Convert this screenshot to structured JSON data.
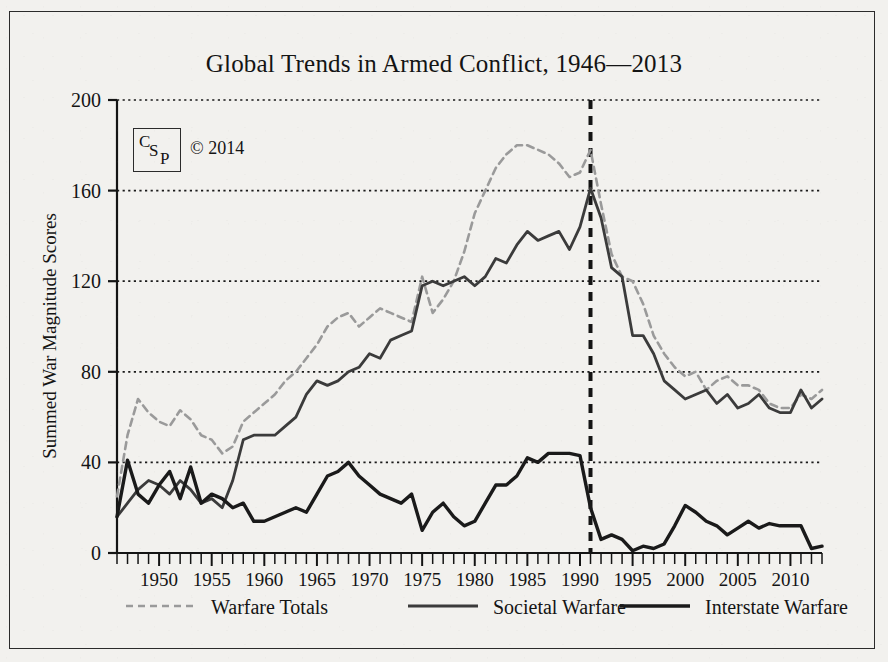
{
  "figure": {
    "background_color": "#f2f1ee",
    "frame_color": "#2b2b2b",
    "ink_color": "#141414"
  },
  "badge": {
    "letter_c": "C",
    "letter_s": "S",
    "letter_p": "P",
    "copyright": "© 2014"
  },
  "chart_data": {
    "type": "line",
    "title": "Global Trends in Armed Conflict,  1946—2013",
    "xlabel": "",
    "ylabel": "Summed War Magnitude Scores",
    "xlim": [
      1946,
      2013
    ],
    "ylim": [
      0,
      200
    ],
    "yticks": [
      0,
      40,
      80,
      120,
      160,
      200
    ],
    "ytick_labels": [
      "0",
      "40",
      "80",
      "120",
      "160",
      "200"
    ],
    "xticks": [
      1950,
      1955,
      1960,
      1965,
      1970,
      1975,
      1980,
      1985,
      1990,
      1995,
      2000,
      2005,
      2010
    ],
    "xtick_labels": [
      "1950",
      "1955",
      "1960",
      "1965",
      "1970",
      "1975",
      "1980",
      "1985",
      "1990",
      "1995",
      "2000",
      "2005",
      "2010"
    ],
    "minor_xtick_interval": 1,
    "grid": "horizontal-dotted",
    "grid_color": "#1a1a1a",
    "legend_position": "below-axis",
    "annotations": [
      {
        "type": "vline",
        "x": 1991,
        "style": "dashed",
        "color": "#141414",
        "width": 4
      }
    ],
    "x": [
      1946,
      1947,
      1948,
      1949,
      1950,
      1951,
      1952,
      1953,
      1954,
      1955,
      1956,
      1957,
      1958,
      1959,
      1960,
      1961,
      1962,
      1963,
      1964,
      1965,
      1966,
      1967,
      1968,
      1969,
      1970,
      1971,
      1972,
      1973,
      1974,
      1975,
      1976,
      1977,
      1978,
      1979,
      1980,
      1981,
      1982,
      1983,
      1984,
      1985,
      1986,
      1987,
      1988,
      1989,
      1990,
      1991,
      1992,
      1993,
      1994,
      1995,
      1996,
      1997,
      1998,
      1999,
      2000,
      2001,
      2002,
      2003,
      2004,
      2005,
      2006,
      2007,
      2008,
      2009,
      2010,
      2011,
      2012,
      2013
    ],
    "series": [
      {
        "name": "Warfare Totals",
        "style": "dashed",
        "color": "#9a9a9a",
        "width": 2.6,
        "values": [
          25,
          52,
          68,
          62,
          58,
          56,
          63,
          59,
          52,
          50,
          44,
          47,
          58,
          62,
          66,
          70,
          76,
          80,
          86,
          92,
          100,
          104,
          106,
          100,
          104,
          108,
          106,
          104,
          102,
          122,
          106,
          112,
          120,
          133,
          150,
          160,
          170,
          176,
          180,
          180,
          178,
          176,
          172,
          166,
          168,
          178,
          154,
          132,
          122,
          120,
          110,
          96,
          88,
          82,
          78,
          80,
          72,
          76,
          78,
          74,
          74,
          72,
          66,
          64,
          64,
          70,
          68,
          72
        ]
      },
      {
        "name": "Societal Warfare",
        "style": "solid-thin",
        "color": "#3b3b3b",
        "width": 2.8,
        "values": [
          16,
          22,
          28,
          32,
          30,
          26,
          32,
          28,
          22,
          24,
          20,
          32,
          50,
          52,
          52,
          52,
          56,
          60,
          70,
          76,
          74,
          76,
          80,
          82,
          88,
          86,
          94,
          96,
          98,
          118,
          120,
          118,
          120,
          122,
          118,
          122,
          130,
          128,
          136,
          142,
          138,
          140,
          142,
          134,
          144,
          161,
          148,
          126,
          122,
          96,
          96,
          88,
          76,
          72,
          68,
          70,
          72,
          66,
          70,
          64,
          66,
          70,
          64,
          62,
          62,
          72,
          64,
          68
        ]
      },
      {
        "name": "Interstate Warfare",
        "style": "solid-thick",
        "color": "#1a1a1a",
        "width": 3.4,
        "values": [
          16,
          41,
          26,
          22,
          30,
          36,
          24,
          38,
          22,
          26,
          24,
          20,
          22,
          14,
          14,
          16,
          18,
          20,
          18,
          26,
          34,
          36,
          40,
          34,
          30,
          26,
          24,
          22,
          26,
          10,
          18,
          22,
          16,
          12,
          14,
          22,
          30,
          30,
          34,
          42,
          40,
          44,
          44,
          44,
          43,
          20,
          6,
          8,
          6,
          1,
          3,
          2,
          4,
          12,
          21,
          18,
          14,
          12,
          8,
          11,
          14,
          11,
          13,
          12,
          12,
          12,
          2,
          3
        ]
      }
    ]
  },
  "legend": {
    "items": [
      {
        "label": "Warfare Totals",
        "style": "dashed"
      },
      {
        "label": "Societal Warfare",
        "style": "solid-thin"
      },
      {
        "label": "Interstate Warfare",
        "style": "solid-thick"
      }
    ]
  }
}
